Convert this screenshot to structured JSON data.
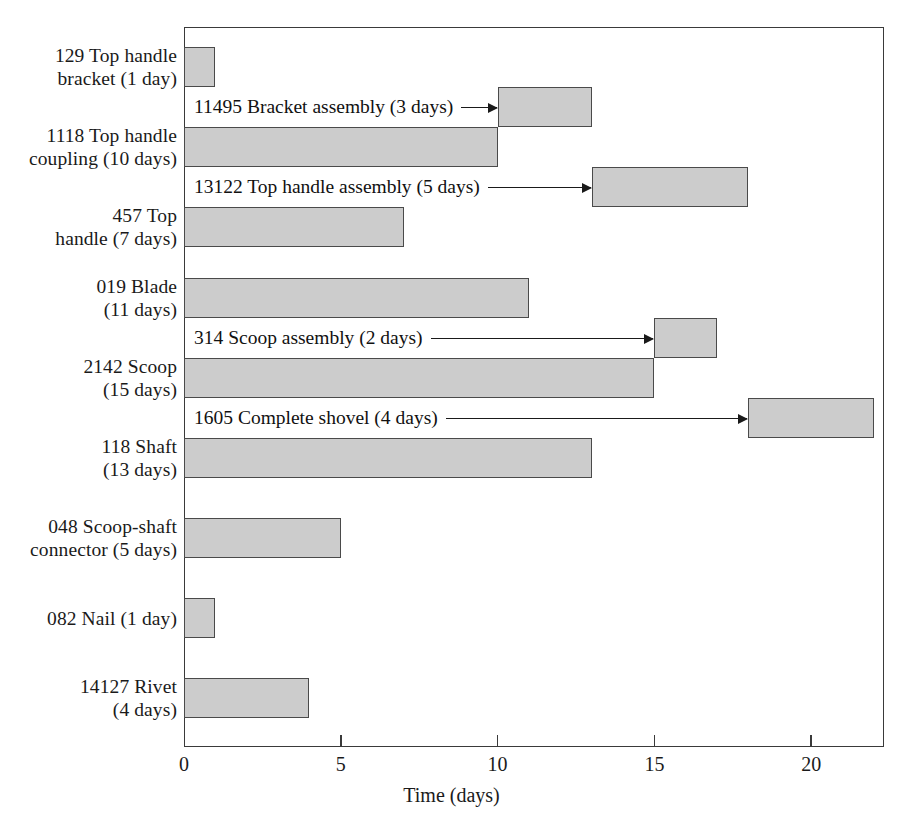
{
  "chart_data": {
    "type": "bar",
    "title": "",
    "xlabel": "Time (days)",
    "ylabel": "",
    "xlim": [
      0,
      22.35
    ],
    "xticks": [
      0,
      5,
      10,
      15,
      20
    ],
    "xtick_labels": [
      "0",
      "5",
      "10",
      "15",
      "20"
    ],
    "grid": false,
    "legend": "none",
    "orientation": "horizontal",
    "bar_fill": "#cccccc",
    "bar_border": "#4a4a4a",
    "categories": [
      "129 Top handle bracket (1 day)",
      "11495 Bracket assembly (3 days)",
      "1118 Top handle coupling (10 days)",
      "13122 Top handle assembly (5 days)",
      "457 Top handle (7 days)",
      "019 Blade (11 days)",
      "314 Scoop assembly (2 days)",
      "2142 Scoop (15 days)",
      "1605 Complete shovel (4 days)",
      "118 Shaft (13 days)",
      "048 Scoop-shaft connector (5 days)",
      "082 Nail (1 day)",
      "14127 Rivet (4 days)"
    ],
    "values": [
      1,
      3,
      10,
      5,
      7,
      11,
      2,
      15,
      4,
      13,
      5,
      1,
      4
    ],
    "starts": [
      0,
      10,
      0,
      13,
      0,
      0,
      15,
      0,
      18,
      0,
      0,
      0,
      0
    ],
    "ends": [
      1,
      13,
      10,
      18,
      7,
      11,
      17,
      15,
      22,
      13,
      5,
      1,
      4
    ]
  },
  "axis": {
    "title": "Time (days)",
    "ticks": [
      {
        "label": "0",
        "value": 0
      },
      {
        "label": "5",
        "value": 5
      },
      {
        "label": "10",
        "value": 10
      },
      {
        "label": "15",
        "value": 15
      },
      {
        "label": "20",
        "value": 20
      }
    ]
  },
  "rows": [
    {
      "kind": "part",
      "name": "129 Top handle bracket",
      "label": "129 Top handle\nbracket (1 day)",
      "duration": "1 day",
      "start": 0,
      "end": 1,
      "top": 47,
      "height": 40
    },
    {
      "kind": "assembly",
      "name": "11495 Bracket assembly",
      "label": "11495 Bracket assembly (3 days)",
      "duration": "3 days",
      "start": 10,
      "end": 13,
      "top": 87,
      "height": 40
    },
    {
      "kind": "part",
      "name": "1118 Top handle coupling",
      "label": "1118 Top handle\ncoupling (10 days)",
      "duration": "10 days",
      "start": 0,
      "end": 10,
      "top": 127,
      "height": 40
    },
    {
      "kind": "assembly",
      "name": "13122 Top handle assembly",
      "label": "13122 Top handle assembly (5 days)",
      "duration": "5 days",
      "start": 13,
      "end": 18,
      "top": 167,
      "height": 40
    },
    {
      "kind": "part",
      "name": "457 Top handle",
      "label": "457 Top\nhandle (7 days)",
      "duration": "7 days",
      "start": 0,
      "end": 7,
      "top": 207,
      "height": 40
    },
    {
      "kind": "part",
      "name": "019 Blade",
      "label": "019 Blade\n(11 days)",
      "duration": "11 days",
      "start": 0,
      "end": 11,
      "top": 278,
      "height": 40
    },
    {
      "kind": "assembly",
      "name": "314 Scoop assembly",
      "label": "314 Scoop assembly (2 days)",
      "duration": "2 days",
      "start": 15,
      "end": 17,
      "top": 318,
      "height": 40
    },
    {
      "kind": "part",
      "name": "2142 Scoop",
      "label": "2142 Scoop\n(15 days)",
      "duration": "15 days",
      "start": 0,
      "end": 15,
      "top": 358,
      "height": 40
    },
    {
      "kind": "assembly",
      "name": "1605 Complete shovel",
      "label": "1605 Complete shovel (4 days)",
      "duration": "4 days",
      "start": 18,
      "end": 22,
      "top": 398,
      "height": 40
    },
    {
      "kind": "part",
      "name": "118 Shaft",
      "label": "118 Shaft\n(13 days)",
      "duration": "13 days",
      "start": 0,
      "end": 13,
      "top": 438,
      "height": 40
    },
    {
      "kind": "part",
      "name": "048 Scoop-shaft connector",
      "label": "048 Scoop-shaft\nconnector (5 days)",
      "duration": "5 days",
      "start": 0,
      "end": 5,
      "top": 518,
      "height": 40
    },
    {
      "kind": "part",
      "name": "082 Nail",
      "label": "082 Nail (1 day)",
      "duration": "1 day",
      "start": 0,
      "end": 1,
      "top": 598,
      "height": 40
    },
    {
      "kind": "part",
      "name": "14127 Rivet",
      "label": "14127 Rivet\n(4 days)",
      "duration": "4 days",
      "start": 0,
      "end": 4,
      "top": 678,
      "height": 40
    }
  ]
}
